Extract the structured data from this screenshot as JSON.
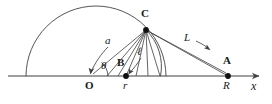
{
  "figure": {
    "kind": "geometry-diagram",
    "stroke_color": "#3f3f3f",
    "text_color": "#1a1a1a",
    "background_color": "#ffffff",
    "width": 272,
    "height": 104
  },
  "axis": {
    "name": "x-axis",
    "label": "x",
    "y": 76,
    "x_start": 8,
    "x_end": 264,
    "arrow": "right"
  },
  "points": [
    {
      "id": "O",
      "label": "O",
      "x": 89,
      "y": 76,
      "label_x": 85,
      "label_y": 82,
      "dot": false
    },
    {
      "id": "B",
      "label": "B",
      "x": 126,
      "y": 76,
      "label_x": 118,
      "label_y": 60,
      "dot": true
    },
    {
      "id": "C",
      "label": "C",
      "x": 146,
      "y": 30,
      "label_x": 142,
      "label_y": 10,
      "dot": true
    },
    {
      "id": "A",
      "label": "A",
      "x": 228,
      "y": 76,
      "label_x": 224,
      "label_y": 58,
      "dot": true
    }
  ],
  "segment_labels": [
    {
      "id": "a",
      "label": "a",
      "x": 108,
      "y": 40,
      "style": "italic"
    },
    {
      "id": "ell",
      "label": "ℓ",
      "x": 140,
      "y": 51,
      "style": "italic"
    },
    {
      "id": "L",
      "label": "L",
      "x": 186,
      "y": 37,
      "style": "italic"
    },
    {
      "id": "theta",
      "label": "θ",
      "x": 103,
      "y": 64,
      "style": "italic"
    },
    {
      "id": "r",
      "label": "r",
      "x": 124,
      "y": 83,
      "style": "italic"
    },
    {
      "id": "R",
      "label": "R",
      "x": 224,
      "y": 83,
      "style": "italic"
    },
    {
      "id": "x",
      "label": "x",
      "x": 253,
      "y": 83,
      "style": "italic-lg"
    }
  ],
  "arcs": [
    {
      "id": "large-arc",
      "from_x": 26,
      "to_x": 166,
      "peak_y": 8,
      "description": "large semicircular arc centered near x=96 on the axis passing over C region"
    },
    {
      "id": "small-arc",
      "from_x": 160,
      "description": "smaller arc from C curving down to the axis near x=160, centered at B"
    }
  ],
  "rays": {
    "description": "fan of straight segments radiating from point C down toward the axis between O and A",
    "count": 8
  }
}
